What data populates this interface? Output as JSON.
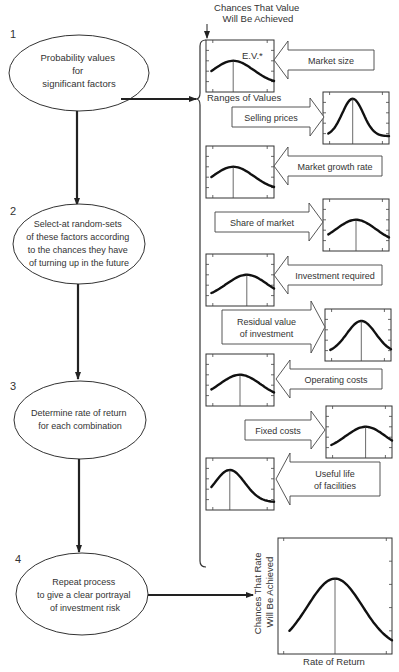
{
  "steps": [
    {
      "number": "1",
      "lines": [
        "Probability values",
        "for",
        "significant factors"
      ]
    },
    {
      "number": "2",
      "lines": [
        "Select-at random-sets",
        "of these factors according",
        "to the chances they have",
        "of turning up in the future"
      ]
    },
    {
      "number": "3",
      "lines": [
        "Determine rate of return",
        "for each combination"
      ]
    },
    {
      "number": "4",
      "lines": [
        "Repeat process",
        "to give a clear portrayal",
        "of investment risk"
      ]
    }
  ],
  "header": {
    "ylabel_line1": "Chances That Value",
    "ylabel_line2": "Will Be Achieved",
    "ev_label": "E.V.*",
    "xlabel": "Ranges of Values"
  },
  "factors": [
    {
      "label": [
        "Market size"
      ],
      "side": "left",
      "peak": 0.4,
      "shape": "broad"
    },
    {
      "label": [
        "Selling prices"
      ],
      "side": "right",
      "peak": 0.45,
      "shape": "narrow"
    },
    {
      "label": [
        "Market growth rate"
      ],
      "side": "left",
      "peak": 0.4,
      "shape": "broad"
    },
    {
      "label": [
        "Share of market"
      ],
      "side": "right",
      "peak": 0.5,
      "shape": "broad"
    },
    {
      "label": [
        "Investment required"
      ],
      "side": "left",
      "peak": 0.6,
      "shape": "broad"
    },
    {
      "label": [
        "Residual value",
        "of investment"
      ],
      "side": "right",
      "peak": 0.55,
      "shape": "medium"
    },
    {
      "label": [
        "Operating costs"
      ],
      "side": "left",
      "peak": 0.5,
      "shape": "broad"
    },
    {
      "label": [
        "Fixed costs"
      ],
      "side": "right",
      "peak": 0.6,
      "shape": "broad"
    },
    {
      "label": [
        "Useful life",
        "of facilities"
      ],
      "side": "left",
      "peak": 0.35,
      "shape": "medium"
    }
  ],
  "result": {
    "ylabel_line1": "Chances That Rate",
    "ylabel_line2": "Will Be Achieved",
    "xlabel": "Rate of Return",
    "peak": 0.5
  }
}
